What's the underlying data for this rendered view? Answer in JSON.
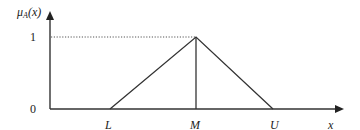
{
  "diagram": {
    "type": "triangular-membership-function",
    "y_axis_label": {
      "mu": "μ",
      "sub": "A",
      "arg": "(x)"
    },
    "x_axis_label": "x",
    "y_ticks": {
      "one": "1",
      "zero": "0"
    },
    "x_points": {
      "L": "L",
      "M": "M",
      "U": "U"
    },
    "colors": {
      "line": "#333333",
      "dotted": "#555555"
    }
  }
}
